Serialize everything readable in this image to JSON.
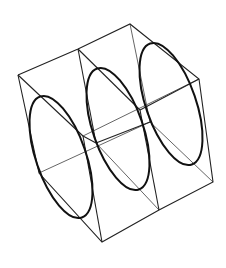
{
  "figure": {
    "title": "",
    "colors": {
      "background": "#ffffff",
      "edge": "#222222",
      "hidden_edge": "#666666",
      "ellipse": "#111111"
    }
  }
}
